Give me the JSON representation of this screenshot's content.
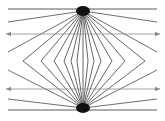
{
  "diagram": {
    "type": "optical-illusion",
    "name": "Hering-style radiating lines with parallel arrows",
    "canvas": {
      "width": 165,
      "height": 121,
      "background": "#ffffff"
    },
    "colors": {
      "rays": "#4a4a4a",
      "hub": "#111111",
      "arrow_lines": "#8a8a8a",
      "edges": "#5a5a5a"
    },
    "top_hub": {
      "x": 83,
      "y": 11
    },
    "bottom_hub": {
      "x": 83,
      "y": 108
    },
    "edge_lines": [
      {
        "x1": 8,
        "y1": 9,
        "x2": 157,
        "y2": 9
      },
      {
        "x1": 8,
        "y1": 110,
        "x2": 157,
        "y2": 110
      }
    ],
    "arrow_lines": [
      {
        "x1": 6,
        "y1": 34,
        "x2": 160,
        "y2": 34,
        "heads": "both"
      },
      {
        "x1": 6,
        "y1": 89,
        "x2": 160,
        "y2": 89,
        "heads": "both"
      }
    ],
    "top_rays_end": [
      {
        "x": 8,
        "y": 22
      },
      {
        "x": 8,
        "y": 52
      },
      {
        "x": 157,
        "y": 22
      },
      {
        "x": 157,
        "y": 52
      }
    ],
    "bottom_rays_end": [
      {
        "x": 8,
        "y": 70
      },
      {
        "x": 8,
        "y": 99
      },
      {
        "x": 157,
        "y": 70
      },
      {
        "x": 157,
        "y": 99
      }
    ],
    "chevron_vertices_y": 61,
    "chevron_vertices_x": [
      23,
      41,
      54,
      64,
      71,
      77,
      83,
      88,
      94,
      101,
      112,
      125,
      145
    ]
  }
}
